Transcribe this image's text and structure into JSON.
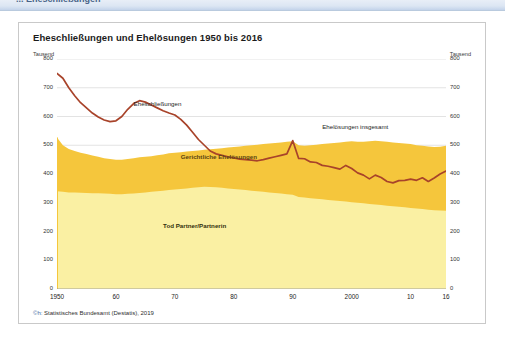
{
  "top_strip": {
    "breadcrumb": "... Eheschließungen"
  },
  "figure": {
    "title": "Eheschließungen und Ehelösungen 1950 bis 2016",
    "unit_left": "Tausend",
    "unit_right": "Tausend",
    "source": "Statistisches Bundesamt (Destatis), 2019",
    "copyright_symbol": "©h:"
  },
  "colors": {
    "line_marriages": "#A8432A",
    "band_court_divorces": "#F5C63C",
    "band_death": "#FAF0A3",
    "band_total_outline": "#E9B829",
    "grid": "#d7d7d7",
    "axis": "#9a9a9a",
    "card_border": "#c9c9c9"
  },
  "chart_data": {
    "type": "area",
    "title": "Eheschließungen und Ehelösungen 1950 bis 2016",
    "subtitle": "",
    "xlabel": "",
    "ylabel": "Tausend",
    "unit": "Tausend",
    "xlim": [
      1950,
      2016
    ],
    "ylim": [
      0,
      800
    ],
    "ytick_values": [
      0,
      100,
      200,
      300,
      400,
      500,
      600,
      700,
      800
    ],
    "ytick_labels": [
      "0",
      "100",
      "200",
      "300",
      "400",
      "500",
      "600",
      "700",
      "800"
    ],
    "xtick_values": [
      1950,
      1960,
      1970,
      1980,
      1990,
      2000,
      2010,
      2016
    ],
    "xtick_labels": [
      "1950",
      "60",
      "70",
      "80",
      "90",
      "2000",
      "10",
      "16"
    ],
    "grid": "horizontal",
    "legend_position": "inline-annotations",
    "annotations": [
      {
        "text": "Eheschließungen",
        "x": 1963,
        "y": 640
      },
      {
        "text": "Gerichtliche Ehelösungen",
        "x": 1971,
        "y": 455
      },
      {
        "text": "Ehelösungen insgesamt",
        "x": 1995,
        "y": 560
      },
      {
        "text": "Tod Partner/Partnerin",
        "x": 1968,
        "y": 215
      }
    ],
    "x": [
      1950,
      1951,
      1952,
      1953,
      1954,
      1955,
      1956,
      1957,
      1958,
      1959,
      1960,
      1961,
      1962,
      1963,
      1964,
      1965,
      1966,
      1967,
      1968,
      1969,
      1970,
      1971,
      1972,
      1973,
      1974,
      1975,
      1976,
      1977,
      1978,
      1979,
      1980,
      1981,
      1982,
      1983,
      1984,
      1985,
      1986,
      1987,
      1988,
      1989,
      1990,
      1991,
      1992,
      1993,
      1994,
      1995,
      1996,
      1997,
      1998,
      1999,
      2000,
      2001,
      2002,
      2003,
      2004,
      2005,
      2006,
      2007,
      2008,
      2009,
      2010,
      2011,
      2012,
      2013,
      2014,
      2015,
      2016
    ],
    "series": [
      {
        "name": "Eheschließungen",
        "type": "line",
        "color": "#A8432A",
        "values": [
          750,
          733,
          700,
          672,
          648,
          630,
          612,
          598,
          588,
          582,
          585,
          600,
          625,
          645,
          655,
          650,
          640,
          630,
          620,
          612,
          605,
          590,
          570,
          545,
          520,
          500,
          480,
          470,
          465,
          460,
          456,
          452,
          450,
          448,
          446,
          450,
          455,
          460,
          465,
          470,
          516,
          454,
          453,
          442,
          440,
          430,
          427,
          422,
          417,
          430,
          419,
          404,
          396,
          383,
          396,
          388,
          374,
          369,
          377,
          378,
          382,
          378,
          387,
          374,
          386,
          400,
          410
        ]
      },
      {
        "name": "Ehelösungen insgesamt",
        "type": "area",
        "color": "#F5C63C",
        "values": [
          527,
          500,
          487,
          480,
          474,
          470,
          464,
          460,
          455,
          452,
          450,
          450,
          452,
          455,
          458,
          460,
          462,
          465,
          468,
          472,
          474,
          476,
          478,
          480,
          482,
          484,
          486,
          488,
          490,
          492,
          494,
          496,
          498,
          500,
          502,
          504,
          506,
          508,
          510,
          512,
          514,
          500,
          498,
          500,
          502,
          504,
          506,
          508,
          510,
          512,
          514,
          512,
          512,
          514,
          516,
          514,
          512,
          510,
          508,
          506,
          504,
          500,
          498,
          496,
          494,
          495,
          498
        ]
      },
      {
        "name": "Tod Partner/Partnerin",
        "type": "area",
        "color": "#FAF0A3",
        "values": [
          340,
          338,
          336,
          336,
          335,
          334,
          333,
          333,
          332,
          331,
          330,
          330,
          331,
          332,
          334,
          336,
          338,
          340,
          342,
          344,
          346,
          348,
          350,
          352,
          354,
          356,
          355,
          354,
          352,
          350,
          348,
          346,
          344,
          342,
          340,
          338,
          336,
          334,
          332,
          330,
          328,
          320,
          318,
          316,
          314,
          312,
          310,
          308,
          306,
          304,
          302,
          300,
          298,
          296,
          294,
          292,
          290,
          288,
          286,
          284,
          282,
          280,
          278,
          276,
          274,
          273,
          272
        ]
      },
      {
        "name": "Gerichtliche Ehelösungen",
        "type": "derived-band",
        "color": "#F5C63C",
        "note": "Band zwischen 'Tod Partner/Partnerin' und 'Ehelösungen insgesamt'"
      }
    ]
  }
}
